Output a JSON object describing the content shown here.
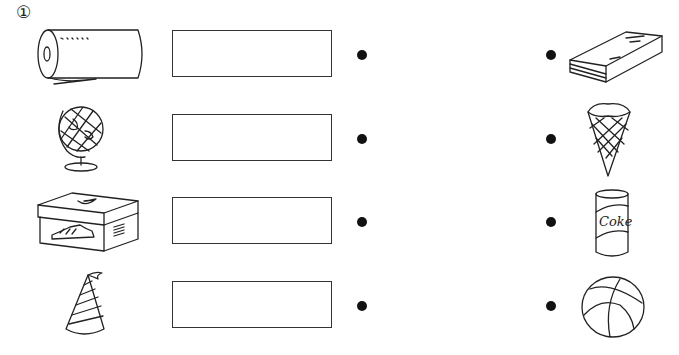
{
  "exercise": {
    "number_label": "①",
    "instruction_visible": false
  },
  "left_items": [
    {
      "name": "paper-towel-roll",
      "answer_box_value": ""
    },
    {
      "name": "globe",
      "answer_box_value": ""
    },
    {
      "name": "shoe-box",
      "answer_box_value": ""
    },
    {
      "name": "party-hat",
      "answer_box_value": ""
    }
  ],
  "right_items": [
    {
      "name": "book"
    },
    {
      "name": "ice-cream-cone"
    },
    {
      "name": "soda-can",
      "label": "Coke"
    },
    {
      "name": "ball"
    }
  ],
  "colors": {
    "ink": "#222222",
    "dot": "#111111",
    "background": "#ffffff"
  }
}
